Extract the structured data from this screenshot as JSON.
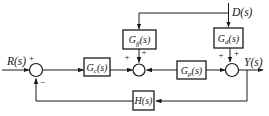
{
  "diagram": {
    "name": "feedforward-disturbance-compensation-control-system",
    "colors": {
      "line": "#1a1a1a",
      "text": "#141414",
      "background": "#ffffff"
    },
    "signals": {
      "reference": "R(s)",
      "disturbance": "D(s)",
      "output": "Y(s)"
    },
    "blocks": {
      "controller": {
        "main": "G",
        "sub": "c",
        "suffix": "(s)"
      },
      "feedforward": {
        "main": "G",
        "sub": "ff",
        "suffix": "(s)"
      },
      "plant": {
        "main": "G",
        "sub": "p",
        "suffix": "(s)"
      },
      "disturbance_tf": {
        "main": "G",
        "sub": "d",
        "suffix": "(s)"
      },
      "feedback": {
        "label": "H(s)"
      }
    },
    "signs": {
      "sum1_reference": "+",
      "sum1_feedback": "−",
      "sum2_controller": "+",
      "sum2_feedforward": "+",
      "sum3_plant": "+",
      "sum3_disturbance": "+"
    }
  }
}
